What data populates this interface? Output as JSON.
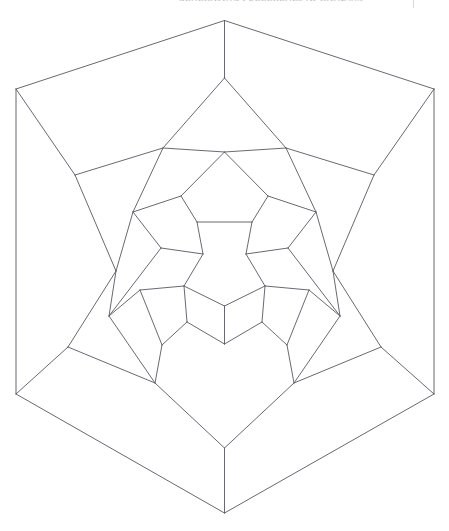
{
  "page": {
    "width": 449,
    "height": 531,
    "background_color": "#ffffff"
  },
  "header": {
    "running_head": "GENERATING FULLERENES AT  RANDOM",
    "rule_present": true
  },
  "figure": {
    "title": "",
    "caption": "",
    "type": "planar-graph-drawing",
    "stroke_color": "#585860",
    "stroke_width": 0.9,
    "fill_color": "none",
    "symmetry_order": 5,
    "center": [
      224.5,
      281.0
    ],
    "outer_face_sides": 5,
    "inner_face_sides": 5,
    "ring_count": 5
  },
  "chart_data": {
    "type": "scatter",
    "title": "",
    "xlabel": "",
    "ylabel": "",
    "grid": false,
    "xlim": [
      0,
      449
    ],
    "ylim": [
      0,
      531
    ],
    "note": "Graph drawing: coordinates are pixel positions; edges are index pairs into vertices.",
    "vertices": [
      [
        224.5,
        20.5
      ],
      [
        16.0,
        89.0
      ],
      [
        434.0,
        89.0
      ],
      [
        16.0,
        394.0
      ],
      [
        434.0,
        394.0
      ],
      [
        224.5,
        513.0
      ],
      [
        224.5,
        78.0
      ],
      [
        75.0,
        175.0
      ],
      [
        374.0,
        175.0
      ],
      [
        68.0,
        347.0
      ],
      [
        381.0,
        347.0
      ],
      [
        224.5,
        448.0
      ],
      [
        163.0,
        148.0
      ],
      [
        286.0,
        148.0
      ],
      [
        116.0,
        271.0
      ],
      [
        333.0,
        271.0
      ],
      [
        155.0,
        383.0
      ],
      [
        294.0,
        383.0
      ],
      [
        224.5,
        152.0
      ],
      [
        181.0,
        196.0
      ],
      [
        268.0,
        196.0
      ],
      [
        133.0,
        212.0
      ],
      [
        316.0,
        212.0
      ],
      [
        109.0,
        316.0
      ],
      [
        340.0,
        316.0
      ],
      [
        162.0,
        345.0
      ],
      [
        287.0,
        345.0
      ],
      [
        197.0,
        222.0
      ],
      [
        252.0,
        222.0
      ],
      [
        161.0,
        248.0
      ],
      [
        288.0,
        248.0
      ],
      [
        140.0,
        290.0
      ],
      [
        309.0,
        290.0
      ],
      [
        187.0,
        322.0
      ],
      [
        262.0,
        322.0
      ],
      [
        224.5,
        344.0
      ],
      [
        203.0,
        254.0
      ],
      [
        246.0,
        254.0
      ],
      [
        184.0,
        286.0
      ],
      [
        265.0,
        286.0
      ],
      [
        224.5,
        306.0
      ]
    ],
    "edges": [
      [
        0,
        1
      ],
      [
        1,
        3
      ],
      [
        3,
        5
      ],
      [
        5,
        4
      ],
      [
        4,
        2
      ],
      [
        2,
        0
      ],
      [
        0,
        6
      ],
      [
        1,
        7
      ],
      [
        2,
        8
      ],
      [
        3,
        9
      ],
      [
        4,
        10
      ],
      [
        5,
        11
      ],
      [
        6,
        12
      ],
      [
        6,
        13
      ],
      [
        7,
        12
      ],
      [
        7,
        14
      ],
      [
        8,
        13
      ],
      [
        8,
        15
      ],
      [
        9,
        14
      ],
      [
        9,
        16
      ],
      [
        10,
        15
      ],
      [
        10,
        17
      ],
      [
        11,
        16
      ],
      [
        11,
        17
      ],
      [
        12,
        18
      ],
      [
        13,
        18
      ],
      [
        12,
        21
      ],
      [
        13,
        22
      ],
      [
        14,
        21
      ],
      [
        14,
        23
      ],
      [
        15,
        22
      ],
      [
        15,
        24
      ],
      [
        16,
        23
      ],
      [
        16,
        25
      ],
      [
        17,
        24
      ],
      [
        17,
        26
      ],
      [
        18,
        19
      ],
      [
        18,
        20
      ],
      [
        19,
        21
      ],
      [
        20,
        22
      ],
      [
        19,
        27
      ],
      [
        20,
        28
      ],
      [
        21,
        29
      ],
      [
        22,
        30
      ],
      [
        23,
        31
      ],
      [
        24,
        32
      ],
      [
        25,
        31
      ],
      [
        26,
        32
      ],
      [
        25,
        33
      ],
      [
        26,
        34
      ],
      [
        23,
        29
      ],
      [
        24,
        30
      ],
      [
        33,
        35
      ],
      [
        34,
        35
      ],
      [
        27,
        28
      ],
      [
        27,
        36
      ],
      [
        28,
        37
      ],
      [
        29,
        36
      ],
      [
        30,
        37
      ],
      [
        31,
        38
      ],
      [
        32,
        39
      ],
      [
        33,
        38
      ],
      [
        34,
        39
      ],
      [
        35,
        40
      ],
      [
        36,
        38
      ],
      [
        37,
        39
      ],
      [
        38,
        40
      ],
      [
        39,
        40
      ]
    ]
  }
}
